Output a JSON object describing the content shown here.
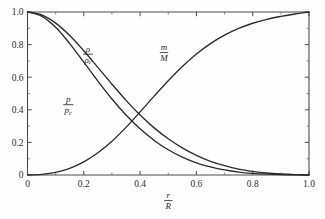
{
  "figure": {
    "background_color": "#fefefe",
    "axis_color": "#4a4a4a",
    "curve_color": "#2b2b2b"
  },
  "chart_data": {
    "type": "line",
    "title": "",
    "subtitle": "",
    "xlabel_numerator": "r",
    "xlabel_denominator": "R",
    "ylabel": "",
    "xlim": [
      0.0,
      1.0
    ],
    "ylim": [
      0.0,
      1.0
    ],
    "grid": false,
    "legend_position": "inline-annotations",
    "xticks": [
      0,
      0.2,
      0.4,
      0.6,
      0.8,
      1.0
    ],
    "xticklabels": [
      "0",
      "0.2",
      "0.4",
      "0.6",
      "0.8",
      "1.0"
    ],
    "yticks": [
      0,
      0.2,
      0.4,
      0.6,
      0.8,
      1.0
    ],
    "yticklabels": [
      "0",
      "0.2",
      "0.4",
      "0.6",
      "0.8",
      "1.0"
    ],
    "xminorticks": [
      0.1,
      0.3,
      0.5,
      0.7,
      0.9
    ],
    "yminorticks": [
      0.1,
      0.3,
      0.5,
      0.7,
      0.9
    ],
    "x": [
      0.0,
      0.05,
      0.1,
      0.15,
      0.2,
      0.25,
      0.3,
      0.35,
      0.4,
      0.45,
      0.5,
      0.55,
      0.6,
      0.65,
      0.7,
      0.75,
      0.8,
      0.85,
      0.9,
      0.95,
      1.0
    ],
    "series": [
      {
        "name": "rho_over_rho_c",
        "label_numerator": "ρ",
        "label_denominator": "ρ",
        "label_denominator_sub": "c",
        "values": [
          1.0,
          0.982,
          0.932,
          0.856,
          0.762,
          0.66,
          0.557,
          0.458,
          0.368,
          0.289,
          0.222,
          0.166,
          0.12,
          0.084,
          0.057,
          0.036,
          0.022,
          0.012,
          0.006,
          0.002,
          0.0
        ],
        "label_x": 0.215,
        "label_y": 0.745
      },
      {
        "name": "p_over_p_c",
        "label_numerator": "p",
        "label_denominator": "p",
        "label_denominator_sub": "c",
        "values": [
          1.0,
          0.975,
          0.906,
          0.806,
          0.692,
          0.576,
          0.466,
          0.368,
          0.283,
          0.212,
          0.155,
          0.11,
          0.075,
          0.05,
          0.031,
          0.018,
          0.01,
          0.005,
          0.002,
          0.001,
          0.0
        ],
        "label_x": 0.145,
        "label_y": 0.435
      },
      {
        "name": "m_over_M",
        "label_numerator": "m",
        "label_denominator": "M",
        "label_denominator_sub": "",
        "values": [
          0.0,
          0.004,
          0.016,
          0.041,
          0.08,
          0.136,
          0.207,
          0.292,
          0.387,
          0.484,
          0.578,
          0.665,
          0.742,
          0.806,
          0.858,
          0.899,
          0.931,
          0.955,
          0.973,
          0.988,
          1.0
        ],
        "label_x": 0.485,
        "label_y": 0.755
      }
    ]
  }
}
